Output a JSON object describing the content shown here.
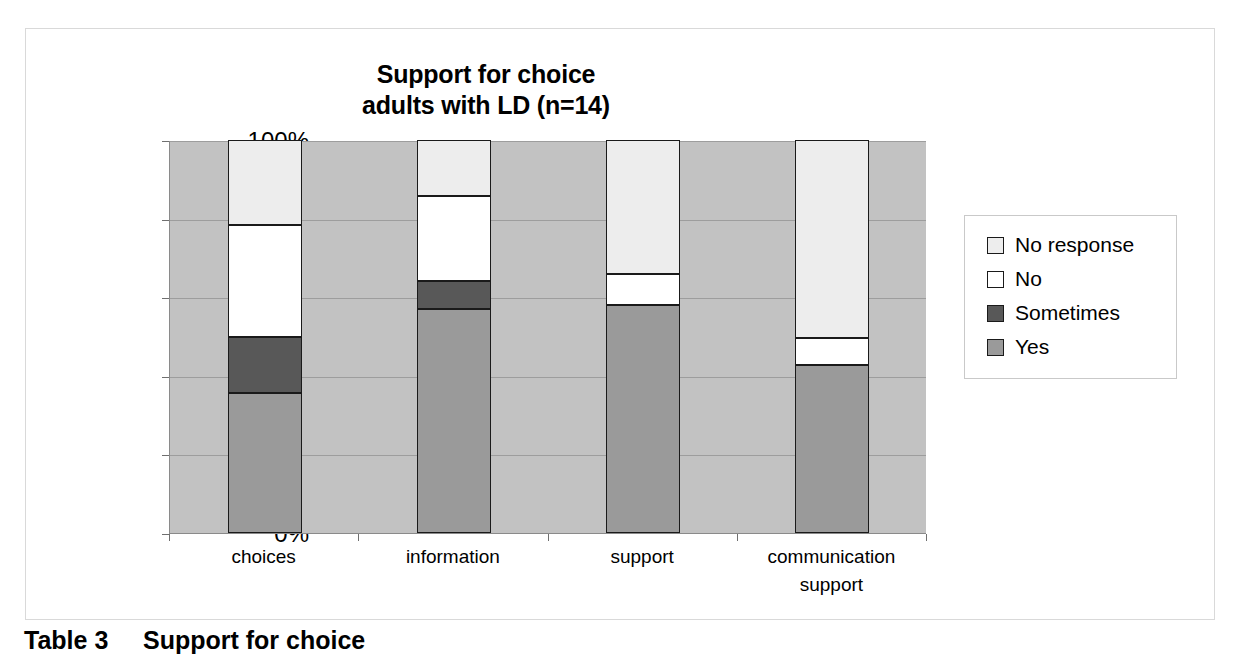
{
  "chart_data": {
    "type": "bar",
    "subtype": "stacked-100-percent",
    "title": "Support for choice adults with LD (n=14)",
    "title_lines": [
      "Support for choice",
      "adults with LD (n=14)"
    ],
    "xlabel": "",
    "ylabel": "",
    "ylim": [
      0,
      100
    ],
    "ytick_labels": [
      "0%",
      "20%",
      "40%",
      "60%",
      "80%",
      "100%"
    ],
    "ytick_values": [
      0,
      20,
      40,
      60,
      80,
      100
    ],
    "grid": true,
    "grid_orientation": "horizontal",
    "legend_position": "right",
    "plot_background": "#c2c2c2",
    "categories": [
      "choices",
      "information",
      "support",
      "communication support"
    ],
    "category_label_lines": [
      [
        "choices"
      ],
      [
        "information"
      ],
      [
        "support"
      ],
      [
        "communication",
        "support"
      ]
    ],
    "series": [
      {
        "name": "Yes",
        "color": "#9a9a9a",
        "values": [
          35.7,
          57.1,
          57.9,
          42.8
        ]
      },
      {
        "name": "Sometimes",
        "color": "#585858",
        "values": [
          14.3,
          7.1,
          0,
          0
        ]
      },
      {
        "name": "No",
        "color": "#ffffff",
        "values": [
          28.5,
          21.5,
          8.1,
          6.7
        ]
      },
      {
        "name": "No response",
        "color": "#ededed",
        "values": [
          21.5,
          14.3,
          34.0,
          50.5
        ]
      }
    ],
    "cumulative_tops": {
      "choices": {
        "Yes": 35.7,
        "Sometimes": 50.0,
        "No": 78.5,
        "No response": 100.0
      },
      "information": {
        "Yes": 57.1,
        "Sometimes": 64.2,
        "No": 85.7,
        "No response": 100.0
      },
      "support": {
        "Yes": 57.9,
        "Sometimes": 57.9,
        "No": 66.0,
        "No response": 100.0
      },
      "communication support": {
        "Yes": 42.8,
        "Sometimes": 42.8,
        "No": 49.5,
        "No response": 100.0
      }
    }
  },
  "legend": {
    "entries": [
      {
        "label": "No response",
        "color": "#ededed"
      },
      {
        "label": "No",
        "color": "#ffffff"
      },
      {
        "label": "Sometimes",
        "color": "#585858"
      },
      {
        "label": "Yes",
        "color": "#9a9a9a"
      }
    ]
  },
  "caption": {
    "text": "Table 3     Support for choice"
  }
}
